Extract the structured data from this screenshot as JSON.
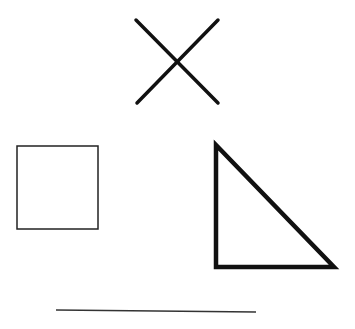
{
  "canvas": {
    "width": 355,
    "height": 329,
    "background": "#ffffff"
  },
  "shapes": {
    "cross": {
      "type": "x-mark",
      "line1": {
        "x1": 136,
        "y1": 20,
        "x2": 218,
        "y2": 103
      },
      "line2": {
        "x1": 218,
        "y1": 20,
        "x2": 137,
        "y2": 103
      },
      "stroke": "#111111",
      "stroke_width": 3.5
    },
    "square": {
      "type": "square",
      "x": 17,
      "y": 146,
      "width": 81,
      "height": 83,
      "stroke": "#222222",
      "stroke_width": 1.5
    },
    "triangle": {
      "type": "right-triangle",
      "points": "216,145 216,267 334,267",
      "stroke": "#111111",
      "stroke_width": 4.5
    },
    "line": {
      "type": "horizontal-line",
      "x1": 56,
      "y1": 310,
      "x2": 256,
      "y2": 312,
      "stroke": "#333333",
      "stroke_width": 1.5
    }
  }
}
